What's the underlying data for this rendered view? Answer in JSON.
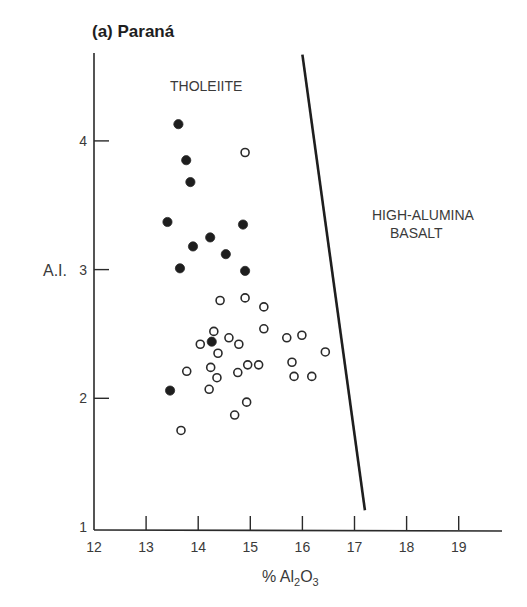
{
  "chart_data": {
    "type": "scatter",
    "title": "(a) Paraná",
    "xlabel": "% Al2O3",
    "xlabel_main": "% Al",
    "xlabel_sub1": "2",
    "xlabel_mid": "O",
    "xlabel_sub2": "3",
    "ylabel": "A.I.",
    "xlim": [
      12,
      19.8
    ],
    "ylim": [
      1,
      4.7
    ],
    "x_ticks": [
      12,
      13,
      14,
      15,
      16,
      17,
      18,
      19
    ],
    "y_ticks": [
      1,
      2,
      3,
      4
    ],
    "grid": false,
    "legend": null,
    "annotations": [
      "THOLEIITE",
      "HIGH-ALUMINA",
      "BASALT"
    ],
    "boundary_line": {
      "x": [
        16.0,
        17.2
      ],
      "y": [
        4.67,
        1.13
      ]
    },
    "series": [
      {
        "name": "filled",
        "marker": "filled-circle",
        "points": [
          [
            13.62,
            4.13
          ],
          [
            13.77,
            3.85
          ],
          [
            13.85,
            3.68
          ],
          [
            13.41,
            3.37
          ],
          [
            14.23,
            3.25
          ],
          [
            14.86,
            3.35
          ],
          [
            13.9,
            3.18
          ],
          [
            14.53,
            3.12
          ],
          [
            13.65,
            3.01
          ],
          [
            14.9,
            2.99
          ],
          [
            14.26,
            2.44
          ],
          [
            13.46,
            2.06
          ]
        ]
      },
      {
        "name": "open",
        "marker": "open-circle",
        "points": [
          [
            14.9,
            3.91
          ],
          [
            14.42,
            2.76
          ],
          [
            14.9,
            2.78
          ],
          [
            15.26,
            2.71
          ],
          [
            15.26,
            2.54
          ],
          [
            14.3,
            2.52
          ],
          [
            14.59,
            2.47
          ],
          [
            14.04,
            2.42
          ],
          [
            14.78,
            2.42
          ],
          [
            14.38,
            2.35
          ],
          [
            15.7,
            2.47
          ],
          [
            15.99,
            2.49
          ],
          [
            16.44,
            2.36
          ],
          [
            15.8,
            2.28
          ],
          [
            13.78,
            2.21
          ],
          [
            14.24,
            2.24
          ],
          [
            14.76,
            2.2
          ],
          [
            14.95,
            2.26
          ],
          [
            15.16,
            2.26
          ],
          [
            15.84,
            2.17
          ],
          [
            16.18,
            2.17
          ],
          [
            14.36,
            2.16
          ],
          [
            14.21,
            2.07
          ],
          [
            14.93,
            1.97
          ],
          [
            14.7,
            1.87
          ],
          [
            13.67,
            1.75
          ]
        ]
      }
    ]
  }
}
